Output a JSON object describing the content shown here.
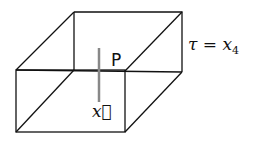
{
  "diagram": {
    "type": "3d-box",
    "labels": {
      "point": "P",
      "vector": "x⃗",
      "time_eq": "τ = x",
      "time_sub": "4"
    },
    "colors": {
      "edge": "#111111",
      "pole": "#888888"
    }
  }
}
